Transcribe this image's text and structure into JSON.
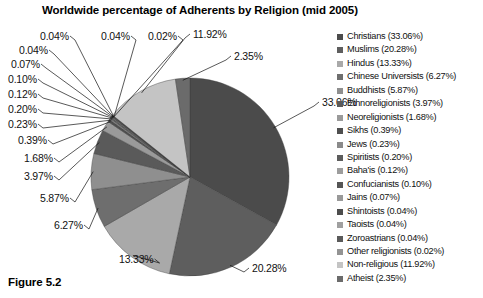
{
  "figure": {
    "caption": "Figure 5.2"
  },
  "chart_data": {
    "type": "pie",
    "title": "Worldwide percentage of Adherents by Religion (mid 2005)",
    "xlabel": "",
    "ylabel": "",
    "units": "percent",
    "start_angle_deg": 0,
    "direction": "clockwise",
    "legend_position": "right",
    "grid": false,
    "categories": [
      "Christians",
      "Muslims",
      "Hindus",
      "Chinese Universists",
      "Buddhists",
      "Ethnoreligionists",
      "Neoreligionists",
      "Sikhs",
      "Jews",
      "Spiritists",
      "Baha'is",
      "Confucianists",
      "Jains",
      "Shintoists",
      "Taoists",
      "Zoroastrians",
      "Other religionists",
      "Non-religious",
      "Atheist"
    ],
    "values": [
      33.06,
      20.28,
      13.33,
      6.27,
      5.87,
      3.97,
      1.68,
      0.39,
      0.23,
      0.2,
      0.12,
      0.1,
      0.07,
      0.04,
      0.04,
      0.04,
      0.02,
      11.92,
      2.35
    ],
    "colors": [
      "#4b4b4b",
      "#5e5e5e",
      "#a9a9a9",
      "#6e6e6e",
      "#8f8f8f",
      "#5a5a5a",
      "#9a9a9a",
      "#4f4f4f",
      "#8a8a8a",
      "#5c5c5c",
      "#9d9d9d",
      "#555555",
      "#999999",
      "#4d4d4d",
      "#a0a0a0",
      "#5a5a5a",
      "#939393",
      "#c4c4c4",
      "#6b6b6b"
    ],
    "legend_entries": [
      {
        "label": "Christians (33.06%)",
        "color": "#4b4b4b"
      },
      {
        "label": "Muslims (20.28%)",
        "color": "#5e5e5e"
      },
      {
        "label": "Hindus (13.33%)",
        "color": "#a9a9a9"
      },
      {
        "label": "Chinese Universists (6.27%)",
        "color": "#6e6e6e"
      },
      {
        "label": "Buddhists (5.87%)",
        "color": "#8f8f8f"
      },
      {
        "label": "Ethnoreligionists (3.97%)",
        "color": "#5a5a5a"
      },
      {
        "label": "Neoreligionists (1.68%)",
        "color": "#9a9a9a"
      },
      {
        "label": "Sikhs (0.39%)",
        "color": "#4f4f4f"
      },
      {
        "label": "Jews (0.23%)",
        "color": "#8a8a8a"
      },
      {
        "label": "Spiritists (0.20%)",
        "color": "#5c5c5c"
      },
      {
        "label": "Baha'is (0.12%)",
        "color": "#9d9d9d"
      },
      {
        "label": "Confucianists (0.10%)",
        "color": "#555555"
      },
      {
        "label": "Jains (0.07%)",
        "color": "#999999"
      },
      {
        "label": "Shintoists (0.04%)",
        "color": "#4d4d4d"
      },
      {
        "label": "Taoists (0.04%)",
        "color": "#a0a0a0"
      },
      {
        "label": "Zoroastrians (0.04%)",
        "color": "#5a5a5a"
      },
      {
        "label": "Other religionists (0.02%)",
        "color": "#939393"
      },
      {
        "label": "Non-religious (11.92%)",
        "color": "#c4c4c4"
      },
      {
        "label": "Atheist (2.35%)",
        "color": "#6b6b6b"
      }
    ],
    "callouts": [
      {
        "text": "33.06%",
        "x": 322,
        "y": 96,
        "anchor": "start"
      },
      {
        "text": "20.28%",
        "x": 252,
        "y": 262,
        "anchor": "start"
      },
      {
        "text": "13.33%",
        "x": 119,
        "y": 253,
        "anchor": "start"
      },
      {
        "text": "6.27%",
        "x": 54,
        "y": 219,
        "anchor": "start"
      },
      {
        "text": "5.87%",
        "x": 40,
        "y": 192,
        "anchor": "start"
      },
      {
        "text": "3.97%",
        "x": 24,
        "y": 170,
        "anchor": "start"
      },
      {
        "text": "1.68%",
        "x": 24,
        "y": 152,
        "anchor": "start"
      },
      {
        "text": "0.39%",
        "x": 18,
        "y": 134,
        "anchor": "start"
      },
      {
        "text": "0.23%",
        "x": 8,
        "y": 118,
        "anchor": "start"
      },
      {
        "text": "0.20%",
        "x": 8,
        "y": 103,
        "anchor": "start"
      },
      {
        "text": "0.12%",
        "x": 8,
        "y": 88,
        "anchor": "start"
      },
      {
        "text": "0.10%",
        "x": 8,
        "y": 73,
        "anchor": "start"
      },
      {
        "text": "0.07%",
        "x": 11,
        "y": 58,
        "anchor": "start"
      },
      {
        "text": "0.04%",
        "x": 19,
        "y": 44,
        "anchor": "start"
      },
      {
        "text": "0.04%",
        "x": 40,
        "y": 30,
        "anchor": "start"
      },
      {
        "text": "0.04%",
        "x": 101,
        "y": 30,
        "anchor": "start"
      },
      {
        "text": "0.02%",
        "x": 148,
        "y": 30,
        "anchor": "start"
      },
      {
        "text": "11.92%",
        "x": 193,
        "y": 28,
        "anchor": "start"
      },
      {
        "text": "2.35%",
        "x": 234,
        "y": 50,
        "anchor": "start"
      }
    ]
  }
}
